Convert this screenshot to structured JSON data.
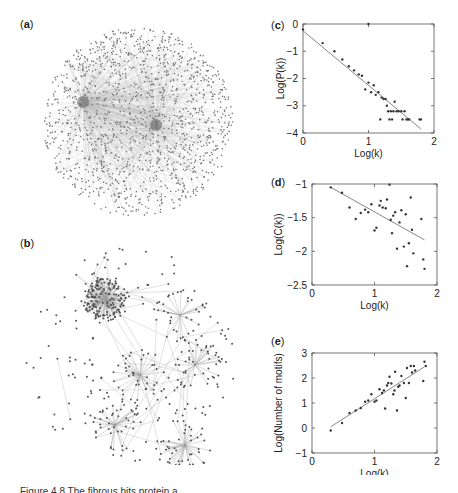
{
  "panels": {
    "a": {
      "label_open": "(",
      "label_letter": "a",
      "label_close": ")",
      "description": "dense protein interaction network"
    },
    "b": {
      "label_open": "(",
      "label_letter": "b",
      "label_close": ")",
      "description": "sparser protein interaction network"
    },
    "c": {
      "label_open": "(",
      "label_letter": "c",
      "label_close": ")"
    },
    "d": {
      "label_open": "(",
      "label_letter": "d",
      "label_close": ")"
    },
    "e": {
      "label_open": "(",
      "label_letter": "e",
      "label_close": ")"
    }
  },
  "caption": "Figure 4.8  The fibrous bits protein a...",
  "chart_data": [
    {
      "id": "c",
      "type": "scatter",
      "title": "",
      "xlabel": "Log(k)",
      "ylabel": "Log(P(k))",
      "xlim": [
        0,
        2
      ],
      "ylim": [
        -4,
        0
      ],
      "xticks": [
        "0",
        "1",
        "2"
      ],
      "yticks": [
        "0",
        "-1",
        "-2",
        "-3",
        "-4"
      ],
      "grid": false,
      "points": [
        [
          0.0,
          -0.2
        ],
        [
          0.3,
          -0.7
        ],
        [
          0.48,
          -1.0
        ],
        [
          0.6,
          -1.3
        ],
        [
          0.7,
          -1.55
        ],
        [
          0.78,
          -1.7
        ],
        [
          0.85,
          -1.85
        ],
        [
          0.9,
          -1.9
        ],
        [
          0.95,
          -2.4
        ],
        [
          1.0,
          -2.15
        ],
        [
          1.04,
          -2.5
        ],
        [
          1.08,
          -2.25
        ],
        [
          1.11,
          -2.6
        ],
        [
          1.15,
          -2.5
        ],
        [
          1.18,
          -3.5
        ],
        [
          1.2,
          -2.7
        ],
        [
          1.23,
          -2.75
        ],
        [
          1.26,
          -2.75
        ],
        [
          1.28,
          -3.0
        ],
        [
          1.3,
          -3.2
        ],
        [
          1.32,
          -3.5
        ],
        [
          1.34,
          -3.2
        ],
        [
          1.36,
          -3.5
        ],
        [
          1.38,
          -3.2
        ],
        [
          1.4,
          -2.85
        ],
        [
          1.43,
          -3.2
        ],
        [
          1.46,
          -3.2
        ],
        [
          1.5,
          -3.2
        ],
        [
          1.52,
          -3.5
        ],
        [
          1.55,
          -3.2
        ],
        [
          1.58,
          -3.5
        ],
        [
          1.6,
          -3.5
        ],
        [
          1.62,
          -3.5
        ],
        [
          1.78,
          -3.5
        ],
        [
          1.8,
          -3.5
        ],
        [
          1.0,
          0.0
        ]
      ],
      "fit_line": {
        "x": [
          0.0,
          1.8
        ],
        "y": [
          -0.25,
          -3.85
        ]
      }
    },
    {
      "id": "d",
      "type": "scatter",
      "title": "",
      "xlabel": "Log(k)",
      "ylabel": "Log(C(k))",
      "xlim": [
        0,
        2
      ],
      "ylim": [
        -2.5,
        -1
      ],
      "xticks": [
        "0",
        "1",
        "2"
      ],
      "yticks": [
        "-1",
        "-1.5",
        "-2",
        "-2.5"
      ],
      "grid": false,
      "points": [
        [
          0.3,
          -1.05
        ],
        [
          0.48,
          -1.13
        ],
        [
          0.6,
          -1.35
        ],
        [
          0.7,
          -1.52
        ],
        [
          0.78,
          -1.43
        ],
        [
          0.85,
          -1.38
        ],
        [
          0.9,
          -1.42
        ],
        [
          0.95,
          -1.3
        ],
        [
          1.0,
          -1.69
        ],
        [
          1.03,
          -1.65
        ],
        [
          1.08,
          -1.32
        ],
        [
          1.1,
          -1.25
        ],
        [
          1.13,
          -1.35
        ],
        [
          1.18,
          -1.36
        ],
        [
          1.2,
          -1.23
        ],
        [
          1.24,
          -1.01
        ],
        [
          1.26,
          -1.53
        ],
        [
          1.28,
          -1.73
        ],
        [
          1.3,
          -1.47
        ],
        [
          1.33,
          -1.42
        ],
        [
          1.36,
          -1.96
        ],
        [
          1.4,
          -1.57
        ],
        [
          1.43,
          -1.39
        ],
        [
          1.47,
          -1.93
        ],
        [
          1.5,
          -1.45
        ],
        [
          1.52,
          -2.22
        ],
        [
          1.55,
          -1.88
        ],
        [
          1.58,
          -1.2
        ],
        [
          1.6,
          -1.68
        ],
        [
          1.62,
          -2.03
        ],
        [
          1.75,
          -1.52
        ],
        [
          1.78,
          -2.12
        ],
        [
          1.8,
          -2.26
        ]
      ],
      "fit_line": {
        "x": [
          0.3,
          1.8
        ],
        "y": [
          -1.05,
          -1.83
        ]
      }
    },
    {
      "id": "e",
      "type": "scatter",
      "title": "",
      "xlabel": "Log(k)",
      "ylabel": "Log(Number of motifs)",
      "xlim": [
        0,
        2
      ],
      "ylim": [
        -1,
        3
      ],
      "xticks": [
        "0",
        "1",
        "2"
      ],
      "yticks": [
        "3",
        "2",
        "1",
        "0",
        "-1"
      ],
      "grid": false,
      "points": [
        [
          0.3,
          -0.1
        ],
        [
          0.48,
          0.2
        ],
        [
          0.6,
          0.6
        ],
        [
          0.7,
          0.7
        ],
        [
          0.78,
          0.8
        ],
        [
          0.85,
          1.05
        ],
        [
          0.9,
          1.1
        ],
        [
          0.95,
          1.35
        ],
        [
          1.0,
          1.05
        ],
        [
          1.03,
          1.1
        ],
        [
          1.08,
          1.55
        ],
        [
          1.12,
          1.4
        ],
        [
          1.15,
          1.5
        ],
        [
          1.17,
          0.78
        ],
        [
          1.2,
          1.7
        ],
        [
          1.22,
          1.8
        ],
        [
          1.24,
          2.05
        ],
        [
          1.27,
          1.78
        ],
        [
          1.3,
          1.35
        ],
        [
          1.32,
          1.5
        ],
        [
          1.33,
          2.25
        ],
        [
          1.36,
          0.7
        ],
        [
          1.38,
          1.65
        ],
        [
          1.4,
          1.7
        ],
        [
          1.43,
          2.08
        ],
        [
          1.47,
          1.8
        ],
        [
          1.5,
          1.2
        ],
        [
          1.52,
          2.4
        ],
        [
          1.55,
          1.8
        ],
        [
          1.58,
          2.48
        ],
        [
          1.6,
          2.22
        ],
        [
          1.63,
          2.48
        ],
        [
          1.65,
          2.3
        ],
        [
          1.78,
          1.88
        ],
        [
          1.8,
          2.65
        ],
        [
          1.82,
          2.48
        ]
      ],
      "fit_line": {
        "x": [
          0.3,
          1.8
        ],
        "y": [
          0.05,
          2.45
        ]
      }
    }
  ]
}
